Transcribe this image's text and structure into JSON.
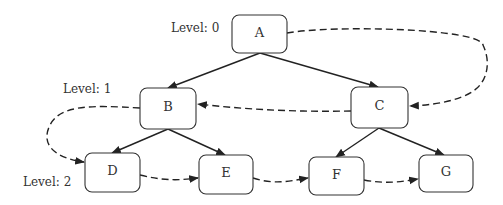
{
  "diagram": {
    "type": "tree-level-order-traversal",
    "levels": [
      {
        "label": "Level: 0"
      },
      {
        "label": "Level: 1"
      },
      {
        "label": "Level: 2"
      }
    ],
    "nodes": [
      {
        "id": "A",
        "label": "A",
        "level": 0
      },
      {
        "id": "B",
        "label": "B",
        "level": 1
      },
      {
        "id": "C",
        "label": "C",
        "level": 1
      },
      {
        "id": "D",
        "label": "D",
        "level": 2
      },
      {
        "id": "E",
        "label": "E",
        "level": 2
      },
      {
        "id": "F",
        "label": "F",
        "level": 2
      },
      {
        "id": "G",
        "label": "G",
        "level": 2
      }
    ],
    "tree_edges": [
      {
        "from": "A",
        "to": "B"
      },
      {
        "from": "A",
        "to": "C"
      },
      {
        "from": "B",
        "to": "D"
      },
      {
        "from": "B",
        "to": "E"
      },
      {
        "from": "C",
        "to": "F"
      },
      {
        "from": "C",
        "to": "G"
      }
    ],
    "traversal_edges": [
      {
        "from": "A",
        "to": "C"
      },
      {
        "from": "C",
        "to": "B"
      },
      {
        "from": "B",
        "to": "D"
      },
      {
        "from": "D",
        "to": "E"
      },
      {
        "from": "E",
        "to": "F"
      },
      {
        "from": "F",
        "to": "G"
      }
    ],
    "colors": {
      "stroke": "#222222",
      "box": "#333333",
      "background": "#ffffff"
    }
  }
}
